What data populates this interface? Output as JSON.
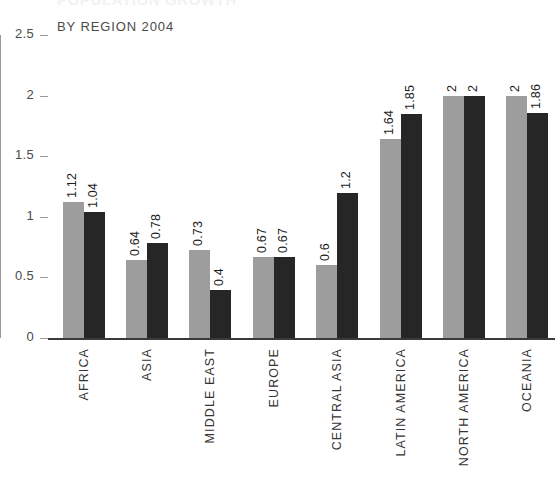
{
  "chart": {
    "title": "POPULATION GROWTH",
    "subtitle": "BY REGION 2004"
  },
  "chart_data": {
    "type": "bar",
    "title": "POPULATION GROWTH",
    "subtitle": "BY REGION 2004",
    "xlabel": "",
    "ylabel": "",
    "ylim": [
      0,
      2.5
    ],
    "yticks": [
      "0",
      "0.5",
      "1",
      "1.5",
      "2",
      "2.5"
    ],
    "ytick_values": [
      0,
      0.5,
      1,
      1.5,
      2,
      2.5
    ],
    "grid": false,
    "legend": "none",
    "categories": [
      "AFRICA",
      "ASIA",
      "MIDDLE EAST",
      "EUROPE",
      "CENTRAL ASIA",
      "LATIN AMERICA",
      "NORTH AMERICA",
      "OCEANIA"
    ],
    "series": [
      {
        "name": "series-1",
        "color": "#9d9d9d",
        "values": [
          1.12,
          0.64,
          0.73,
          0.67,
          0.6,
          1.64,
          2,
          2
        ],
        "labels": [
          "1.12",
          "0.64",
          "0.73",
          "0.67",
          "0.6",
          "1.64",
          "2",
          "2"
        ]
      },
      {
        "name": "series-2",
        "color": "#262626",
        "values": [
          1.04,
          0.78,
          0.4,
          0.67,
          1.2,
          1.85,
          2,
          1.86
        ],
        "labels": [
          "1.04",
          "0.78",
          "0.4",
          "0.67",
          "1.2",
          "1.85",
          "2",
          "1.86"
        ]
      }
    ]
  }
}
